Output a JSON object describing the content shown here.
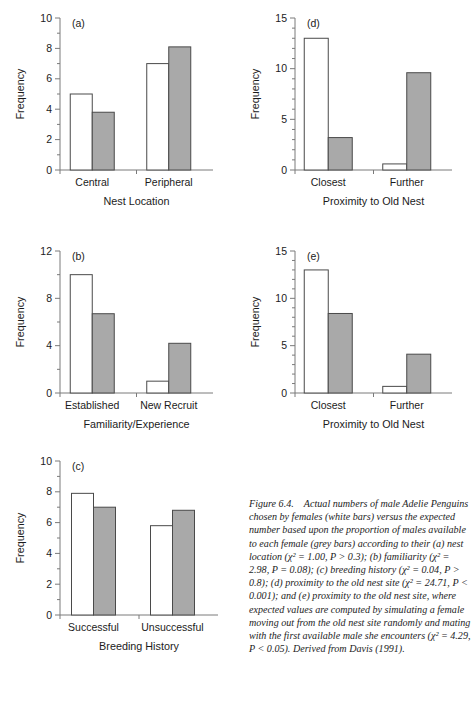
{
  "figure": {
    "id": "Figure 6.4.",
    "caption_text": "Figure 6.4.  Actual numbers of male Adelie Penguins chosen by females (white bars) versus the expected number based upon the proportion of males available to each female (grey bars) according to their (a) nest location (χ² = 1.00, P > 0.3); (b) familiarity (χ² = 2.98, P = 0.08); (c) breeding history (χ² = 0.04, P > 0.8); (d) proximity to the old nest site (χ² = 24.71, P < 0.001); and (e) proximity to the old nest site, where expected values are computed by simulating a female moving out from the old nest site randomly and mating with the first available male she encounters (χ² = 4.29, P < 0.05). Derived from Davis (1991)."
  },
  "legend": {
    "white_series": "Actual (white bars)",
    "grey_series": "Expected (grey bars)"
  },
  "colors": {
    "white_bar_fill": "#ffffff",
    "white_bar_stroke": "#4a4a4a",
    "grey_bar_fill": "#a9a9a9",
    "grey_bar_stroke": "#4a4a4a",
    "axis": "#7a7a7a",
    "text": "#1b1b1b"
  },
  "chart_data": [
    {
      "id": "a",
      "type": "bar",
      "panel_label": "(a)",
      "title": "",
      "xlabel": "Nest Location",
      "ylabel": "Frequency",
      "categories": [
        "Central",
        "Peripheral"
      ],
      "ylim": [
        0,
        10
      ],
      "yticks": [
        0,
        2,
        4,
        6,
        8,
        10
      ],
      "yminor_step": 1,
      "grid": false,
      "legend_position": "none",
      "series": [
        {
          "name": "Actual (white bars)",
          "values": [
            5.0,
            7.0
          ]
        },
        {
          "name": "Expected (grey bars)",
          "values": [
            3.8,
            8.1
          ]
        }
      ],
      "annotation": "χ² = 1.00, P > 0.3"
    },
    {
      "id": "d",
      "type": "bar",
      "panel_label": "(d)",
      "title": "",
      "xlabel": "Proximity to Old Nest",
      "ylabel": "Frequency",
      "categories": [
        "Closest",
        "Further"
      ],
      "ylim": [
        0,
        15
      ],
      "yticks": [
        0,
        5,
        10,
        15
      ],
      "yminor_step": 1,
      "grid": false,
      "legend_position": "none",
      "series": [
        {
          "name": "Actual (white bars)",
          "values": [
            13.0,
            0.6
          ]
        },
        {
          "name": "Expected (grey bars)",
          "values": [
            3.2,
            9.6
          ]
        }
      ],
      "annotation": "χ² = 24.71, P < 0.001"
    },
    {
      "id": "b",
      "type": "bar",
      "panel_label": "(b)",
      "title": "",
      "xlabel": "Familiarity/Experience",
      "ylabel": "Frequency",
      "categories": [
        "Established",
        "New Recruit"
      ],
      "ylim": [
        0,
        12
      ],
      "yticks": [
        0,
        4,
        8,
        12
      ],
      "yminor_step": 2,
      "grid": false,
      "legend_position": "none",
      "series": [
        {
          "name": "Actual (white bars)",
          "values": [
            10.0,
            1.0
          ]
        },
        {
          "name": "Expected (grey bars)",
          "values": [
            6.7,
            4.2
          ]
        }
      ],
      "annotation": "χ² = 2.98, P = 0.08"
    },
    {
      "id": "e",
      "type": "bar",
      "panel_label": "(e)",
      "title": "",
      "xlabel": "Proximity to Old Nest",
      "ylabel": "Frequency",
      "categories": [
        "Closest",
        "Further"
      ],
      "ylim": [
        0,
        15
      ],
      "yticks": [
        0,
        5,
        10,
        15
      ],
      "yminor_step": 1,
      "grid": false,
      "legend_position": "none",
      "series": [
        {
          "name": "Actual (white bars)",
          "values": [
            13.0,
            0.7
          ]
        },
        {
          "name": "Expected (grey bars)",
          "values": [
            8.4,
            4.1
          ]
        }
      ],
      "annotation": "χ² = 4.29, P < 0.05"
    },
    {
      "id": "c",
      "type": "bar",
      "panel_label": "(c)",
      "title": "",
      "xlabel": "Breeding History",
      "ylabel": "Frequency",
      "categories": [
        "Successful",
        "Unsuccessful"
      ],
      "ylim": [
        0,
        10
      ],
      "yticks": [
        0,
        2,
        4,
        6,
        8,
        10
      ],
      "yminor_step": 1,
      "grid": false,
      "legend_position": "none",
      "series": [
        {
          "name": "Actual (white bars)",
          "values": [
            7.9,
            5.8
          ]
        },
        {
          "name": "Expected (grey bars)",
          "values": [
            7.0,
            6.8
          ]
        }
      ],
      "annotation": "χ² = 0.04, P > 0.8"
    }
  ]
}
